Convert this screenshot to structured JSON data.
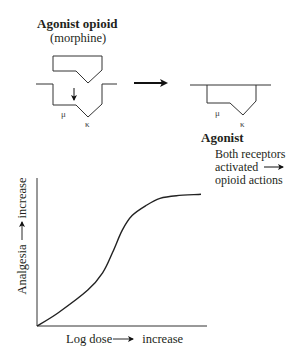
{
  "figure": {
    "before": {
      "title": "Agonist opioid",
      "subtitle": "(morphine)",
      "mu_label": "μ",
      "kappa_label": "κ"
    },
    "after": {
      "title": "Agonist",
      "mu_label": "μ",
      "kappa_label": "κ",
      "note_line1": "Both receptors",
      "note_line2": "activated",
      "note_line3": "opioid actions"
    },
    "transition_arrow": "right-arrow-icon"
  },
  "chart_data": {
    "type": "line",
    "title": "",
    "xlabel_prefix": "Log dose",
    "xlabel_suffix": "increase",
    "ylabel_prefix": "Analgesia",
    "ylabel_suffix": "increase",
    "xlabel": "Log dose → increase",
    "ylabel": "Analgesia → increase",
    "grid": false,
    "legend": null,
    "series": [
      {
        "name": "Dose–response (sigmoid)",
        "x": [
          0,
          0.13,
          0.31,
          0.4,
          0.46,
          0.52,
          0.58,
          0.67,
          0.75,
          0.85,
          1.0
        ],
        "y": [
          0,
          0.1,
          0.27,
          0.4,
          0.55,
          0.72,
          0.83,
          0.91,
          0.96,
          0.98,
          0.99
        ]
      }
    ],
    "xlim": [
      0,
      1
    ],
    "ylim": [
      0,
      1
    ]
  }
}
